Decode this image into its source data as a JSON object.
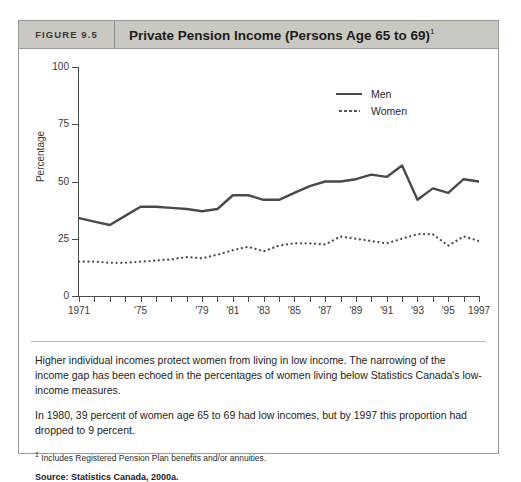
{
  "figure": {
    "number": "FIGURE 9.5",
    "title": "Private Pension Income (Persons Age 65 to 69)",
    "title_superscript": "1"
  },
  "chart_data": {
    "type": "line",
    "title": "Private Pension Income (Persons Age 65 to 69)",
    "xlabel": "",
    "ylabel": "Percentage",
    "ylim": [
      0,
      100
    ],
    "yticks": [
      0,
      25,
      50,
      75,
      100
    ],
    "ytick_labels": [
      "0",
      "25",
      "50",
      "75",
      "100"
    ],
    "grid": false,
    "legend_position": "upper right",
    "x": [
      1971,
      1972,
      1973,
      1974,
      1975,
      1976,
      1977,
      1978,
      1979,
      1980,
      1981,
      1982,
      1983,
      1984,
      1985,
      1986,
      1987,
      1988,
      1989,
      1990,
      1991,
      1992,
      1993,
      1994,
      1995,
      1996,
      1997
    ],
    "xtick_years": [
      1971,
      1972,
      1973,
      1974,
      1975,
      1976,
      1977,
      1978,
      1979,
      1980,
      1981,
      1982,
      1983,
      1984,
      1985,
      1986,
      1987,
      1988,
      1989,
      1990,
      1991,
      1992,
      1993,
      1994,
      1995,
      1996,
      1997
    ],
    "xtick_labels": [
      {
        "year": 1971,
        "label": "1971"
      },
      {
        "year": 1975,
        "label": "'75"
      },
      {
        "year": 1979,
        "label": "'79"
      },
      {
        "year": 1981,
        "label": "'81"
      },
      {
        "year": 1983,
        "label": "'83"
      },
      {
        "year": 1985,
        "label": "'85"
      },
      {
        "year": 1987,
        "label": "'87"
      },
      {
        "year": 1989,
        "label": "'89"
      },
      {
        "year": 1991,
        "label": "'91"
      },
      {
        "year": 1993,
        "label": "'93"
      },
      {
        "year": 1995,
        "label": "'95"
      },
      {
        "year": 1997,
        "label": "1997"
      }
    ],
    "series": [
      {
        "name": "Men",
        "style": "solid",
        "color": "#4a4a48",
        "values": [
          34,
          32.5,
          31,
          35,
          39,
          39,
          38.5,
          38,
          37,
          38,
          44,
          44,
          42,
          42,
          45,
          48,
          50,
          50,
          51,
          53,
          52,
          57,
          42,
          47,
          45,
          51,
          50
        ]
      },
      {
        "name": "Women",
        "style": "dotted",
        "color": "#4a4a48",
        "values": [
          15,
          15,
          14.5,
          14.5,
          15,
          15.5,
          16,
          17,
          16.5,
          18,
          20,
          21.5,
          19.5,
          22,
          23,
          23,
          22.5,
          26,
          25,
          24,
          23,
          25,
          27,
          27,
          22,
          26,
          24
        ]
      }
    ]
  },
  "legend": {
    "items": [
      {
        "label": "Men",
        "style": "solid"
      },
      {
        "label": "Women",
        "style": "dotted"
      }
    ]
  },
  "footer": {
    "paragraph_1": "Higher individual incomes protect women from living in low income. The narrowing of the income gap has been echoed in the percentages of women living below Statistics Canada's low-income measures.",
    "paragraph_2": "In 1980, 39 percent of women age 65 to 69 had low incomes, but by 1997 this proportion had dropped to 9 percent.",
    "footnote_marker": "1",
    "footnote_text": " Includes Registered Pension Plan benefits and/or annuities.",
    "source": "Source: Statistics Canada, 2000a."
  },
  "colors": {
    "header_bg": "#c9c8c2",
    "border": "#9a9a96",
    "line": "#4a4a48",
    "text": "#1d1d1b"
  }
}
